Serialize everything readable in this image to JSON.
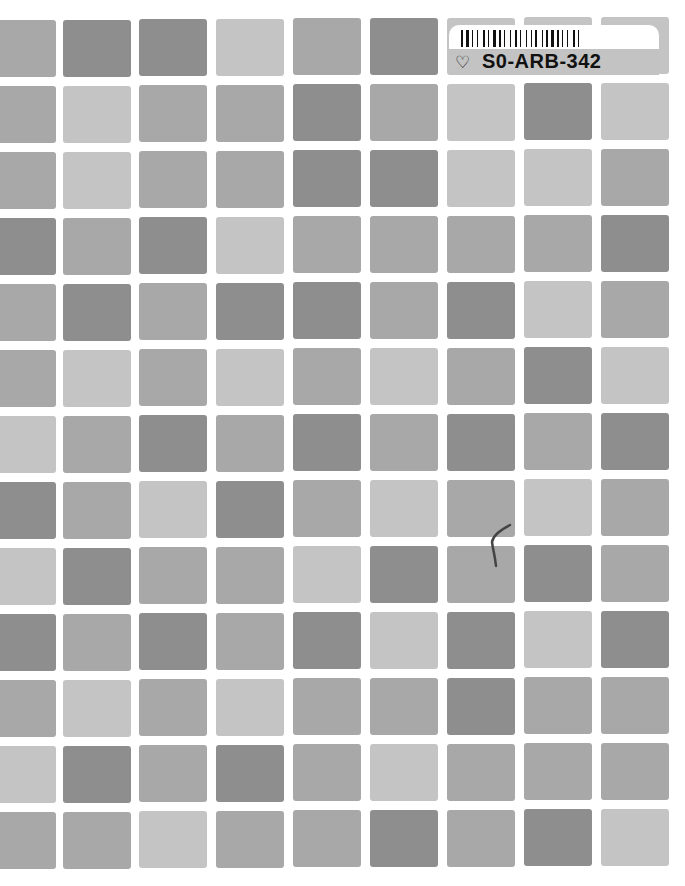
{
  "document": {
    "type": "book-cover",
    "palette": {
      "D": "#8e8e8e",
      "M": "#a8a8a8",
      "L": "#c4c4c4",
      "background": "#ffffff"
    },
    "grid_rows": [
      [
        "M",
        "D",
        "D",
        "L",
        "M",
        "D",
        "L",
        "L",
        "L"
      ],
      [
        "M",
        "L",
        "M",
        "M",
        "D",
        "M",
        "L",
        "D",
        "L"
      ],
      [
        "M",
        "L",
        "M",
        "M",
        "D",
        "D",
        "L",
        "L",
        "M"
      ],
      [
        "D",
        "M",
        "D",
        "L",
        "M",
        "M",
        "M",
        "M",
        "D"
      ],
      [
        "M",
        "D",
        "M",
        "D",
        "D",
        "M",
        "D",
        "L",
        "M"
      ],
      [
        "M",
        "L",
        "M",
        "L",
        "M",
        "L",
        "M",
        "D",
        "L"
      ],
      [
        "L",
        "M",
        "D",
        "M",
        "D",
        "M",
        "D",
        "M",
        "D"
      ],
      [
        "D",
        "M",
        "L",
        "D",
        "M",
        "L",
        "M",
        "L",
        "M"
      ],
      [
        "L",
        "D",
        "M",
        "M",
        "L",
        "D",
        "M",
        "D",
        "M"
      ],
      [
        "D",
        "M",
        "D",
        "M",
        "D",
        "L",
        "D",
        "L",
        "D"
      ],
      [
        "M",
        "L",
        "M",
        "L",
        "M",
        "M",
        "D",
        "M",
        "M"
      ],
      [
        "L",
        "D",
        "M",
        "D",
        "M",
        "L",
        "M",
        "M",
        "M"
      ],
      [
        "M",
        "M",
        "L",
        "M",
        "M",
        "D",
        "M",
        "D",
        "L"
      ]
    ]
  },
  "sticker": {
    "code": "S0-ARB-342",
    "icon": "heart-outline-icon",
    "icon_glyph": "♡"
  }
}
